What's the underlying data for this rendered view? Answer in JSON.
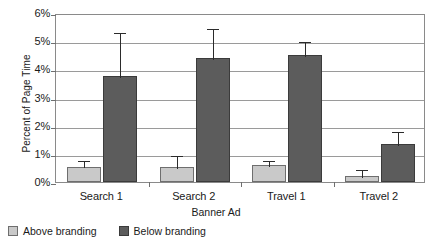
{
  "chart_data": {
    "type": "bar",
    "title": "",
    "xlabel": "Banner Ad",
    "ylabel": "Percent of Page Time",
    "categories": [
      "Search 1",
      "Search 2",
      "Travel 1",
      "Travel 2"
    ],
    "ylim": [
      0,
      6
    ],
    "ytick_labels": [
      "0%",
      "1%",
      "2%",
      "3%",
      "4%",
      "5%",
      "6%"
    ],
    "ytick_values": [
      0,
      1,
      2,
      3,
      4,
      5,
      6
    ],
    "grid": true,
    "legend_position": "bottom-left",
    "value_unit": "%",
    "series": [
      {
        "name": "Above branding",
        "color": "#c9c9c9",
        "values": [
          0.55,
          0.55,
          0.6,
          0.22
        ],
        "errors": [
          0.25,
          0.45,
          0.2,
          0.28
        ]
      },
      {
        "name": "Below branding",
        "color": "#5c5c5c",
        "values": [
          3.75,
          4.4,
          4.5,
          1.35
        ],
        "errors": [
          1.6,
          1.1,
          0.55,
          0.5
        ]
      }
    ]
  }
}
